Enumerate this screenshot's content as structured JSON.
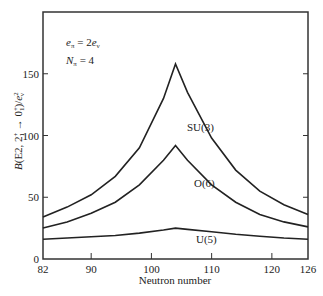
{
  "chart_data": {
    "type": "line",
    "title": "",
    "xlabel": "Neutron number",
    "ylabel": "B(E2, 2₁⁺ → 0₁⁺)/eν²",
    "xlim": [
      82,
      126
    ],
    "ylim": [
      0,
      200
    ],
    "xticks": [
      82,
      90,
      100,
      110,
      120,
      126
    ],
    "yticks": [
      0,
      50,
      100,
      150
    ],
    "grid": false,
    "legend": "none (curves labeled inline)",
    "annotations": [
      "eπ = 2eν",
      "Nπ = 4"
    ],
    "x": [
      82,
      86,
      90,
      94,
      98,
      102,
      104,
      106,
      110,
      114,
      118,
      122,
      126
    ],
    "series": [
      {
        "name": "SU(3)",
        "values": [
          34,
          42,
          52,
          67,
          90,
          130,
          158,
          135,
          98,
          72,
          55,
          44,
          36
        ]
      },
      {
        "name": "O(6)",
        "values": [
          25,
          30,
          37,
          46,
          60,
          80,
          92,
          80,
          60,
          46,
          36,
          30,
          26
        ]
      },
      {
        "name": "U(5)",
        "values": [
          16,
          17,
          18,
          19,
          21,
          23.5,
          25,
          24,
          22,
          20,
          18.5,
          17,
          16
        ]
      }
    ]
  },
  "labels": {
    "x_axis": "Neutron number",
    "y_axis_B": "B",
    "y_axis_rest": "(E2, 2",
    "y_axis_full": "B(E2, 2₁⁺ → 0₁⁺)/e²ν",
    "annot1": "eπ = 2eν",
    "annot2": "Nπ = 4",
    "su3": "SU(3)",
    "o6": "O(6)",
    "u5": "U(5)"
  }
}
